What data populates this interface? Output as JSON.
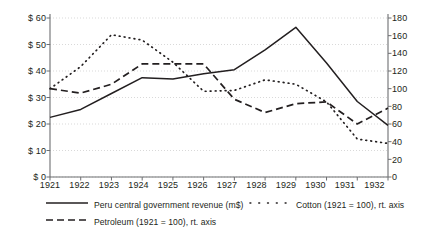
{
  "chart_data": {
    "type": "line",
    "title": "",
    "xlabel": "",
    "ylabel": "",
    "grid": true,
    "legend_position": "bottom",
    "x": [
      1921,
      1922,
      1923,
      1924,
      1925,
      1926,
      1927,
      1928,
      1929,
      1930,
      1931,
      1932
    ],
    "xtick_labels": [
      "1921",
      "1922",
      "1923",
      "1924",
      "1925",
      "1926",
      "1927",
      "1928",
      "1929",
      "1930",
      "1931",
      "1932"
    ],
    "left_axis": {
      "ylim": [
        0,
        60
      ],
      "ticks": [
        0,
        10,
        20,
        30,
        40,
        50,
        60
      ],
      "tick_labels": [
        "$ 0",
        "$ 10",
        "$ 20",
        "$ 30",
        "$ 40",
        "$ 50",
        "$ 60"
      ]
    },
    "right_axis": {
      "ylim": [
        0,
        180
      ],
      "ticks": [
        0,
        20,
        40,
        60,
        80,
        100,
        120,
        140,
        160,
        180
      ],
      "tick_labels": [
        "0",
        "20",
        "40",
        "60",
        "80",
        "100",
        "120",
        "140",
        "160",
        "180"
      ]
    },
    "series": [
      {
        "name": "Peru central government revenue (m$)",
        "axis": "left",
        "style": "solid",
        "color": "#231f20",
        "values": [
          22.5,
          25.5,
          31.5,
          37.5,
          37.0,
          39.0,
          40.5,
          48.0,
          56.5,
          43.0,
          28.5,
          19.5
        ]
      },
      {
        "name": "Petroleum (1921 = 100), rt. axis",
        "axis": "right",
        "style": "dashed",
        "color": "#231f20",
        "values": [
          100,
          95,
          105,
          128,
          128,
          128,
          88,
          73,
          83,
          85,
          60,
          78
        ]
      },
      {
        "name": "Cotton (1921 = 100), rt. axis",
        "axis": "right",
        "style": "dotted",
        "color": "#231f20",
        "values": [
          100,
          125,
          161,
          155,
          130,
          97,
          98,
          110,
          105,
          85,
          43,
          38
        ]
      }
    ]
  },
  "legend": {
    "items": [
      {
        "label": "Peru central government revenue (m$)",
        "style": "solid"
      },
      {
        "label": "Cotton (1921 = 100), rt. axis",
        "style": "dotted"
      },
      {
        "label": "Petroleum (1921 = 100), rt. axis",
        "style": "dashed"
      }
    ]
  },
  "colors": {
    "ink": "#231f20",
    "grid": "#c8c8c8",
    "axis": "#6d6e71",
    "background": "#ffffff"
  }
}
